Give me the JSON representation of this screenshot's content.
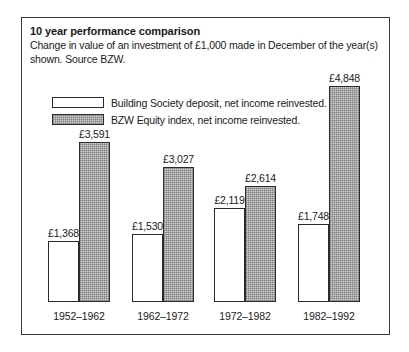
{
  "chart_data": {
    "type": "bar",
    "title": "10 year performance comparison",
    "subtitle": "Change in value of an investment of £1,000 made in December of the year(s) shown. Source BZW.",
    "xlabel": "",
    "ylabel": "",
    "ylim": [
      0,
      4848
    ],
    "grid": false,
    "legend_position": "top-left",
    "categories": [
      "1952–1962",
      "1962–1972",
      "1972–1982",
      "1982–1992"
    ],
    "series": [
      {
        "name": "Building Society deposit, net income reinvested.",
        "swatch": "white",
        "values": [
          1368,
          1530,
          2119,
          1748
        ],
        "labels": [
          "£1,368",
          "£1,530",
          "£2,119",
          "£1,748"
        ]
      },
      {
        "name": "BZW Equity index, net income reinvested.",
        "swatch": "gray",
        "values": [
          3591,
          3027,
          2614,
          4848
        ],
        "labels": [
          "£3,591",
          "£3,027",
          "£2,614",
          "£4,848"
        ]
      }
    ],
    "colors": {
      "series_white": "#ffffff",
      "series_gray": "#d2d2d2",
      "outline": "#2b2b2b",
      "frame": "#3a3a3a",
      "text": "#1a1a1a"
    }
  }
}
